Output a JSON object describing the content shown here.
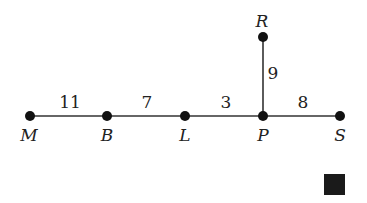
{
  "diagram": {
    "nodes": [
      {
        "id": "M",
        "label": "M"
      },
      {
        "id": "B",
        "label": "B"
      },
      {
        "id": "L",
        "label": "L"
      },
      {
        "id": "P",
        "label": "P"
      },
      {
        "id": "S",
        "label": "S"
      },
      {
        "id": "R",
        "label": "R"
      }
    ],
    "edges": [
      {
        "from": "M",
        "to": "B",
        "weight": "11"
      },
      {
        "from": "B",
        "to": "L",
        "weight": "7"
      },
      {
        "from": "L",
        "to": "P",
        "weight": "3"
      },
      {
        "from": "P",
        "to": "S",
        "weight": "8"
      },
      {
        "from": "P",
        "to": "R",
        "weight": "9"
      }
    ],
    "end_marker": "square"
  }
}
